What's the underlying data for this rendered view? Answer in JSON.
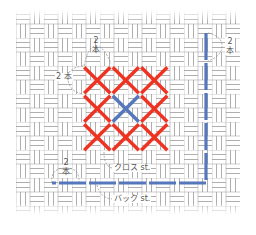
{
  "diagram": {
    "fabric": {
      "type": "basket-weave",
      "line_color": "#9a9a9a",
      "area": {
        "x": 16,
        "y": 10,
        "width": 224,
        "height": 205
      }
    },
    "cross_stitch": {
      "rows": 3,
      "cols": 3,
      "cell_size": 28.5,
      "origin": {
        "x": 83,
        "y": 66
      },
      "default_color": "#ee3322",
      "highlight_color": "#5577bb",
      "highlight_cell": {
        "row": 1,
        "col": 1
      }
    },
    "back_stitch": {
      "color": "#5577bb",
      "path": [
        {
          "x": 206,
          "y": 33
        },
        {
          "x": 206,
          "y": 183
        },
        {
          "x": 52,
          "y": 183
        }
      ],
      "dash": "27 3"
    },
    "labels": {
      "cross_top_count": "2",
      "cross_top_unit": "本",
      "cross_left": "2 本",
      "back_right_count": "2",
      "back_right_unit": "本",
      "back_left_count": "2",
      "back_left_unit": "本",
      "cross_stitch": "クロス st.",
      "back_stitch": "バック st."
    }
  }
}
